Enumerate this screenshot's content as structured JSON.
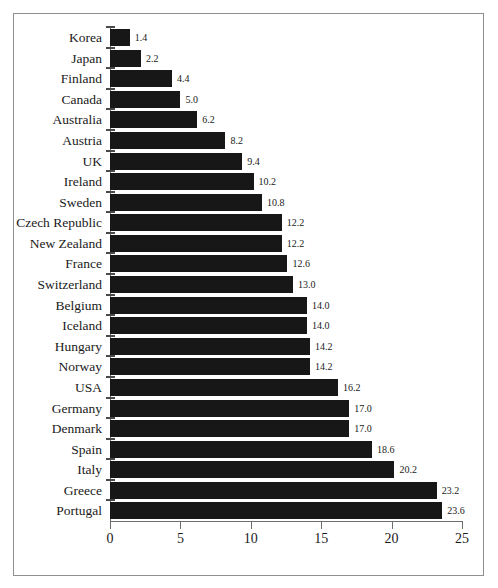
{
  "chart_data": {
    "type": "bar",
    "orientation": "horizontal",
    "title": "",
    "subtitle": "",
    "xlabel": "",
    "ylabel": "",
    "xlim": [
      0,
      25
    ],
    "xticks": [
      0,
      5,
      10,
      15,
      20,
      25
    ],
    "xtick_labels": [
      "0",
      "5",
      "10",
      "15",
      "20",
      "25"
    ],
    "grid": false,
    "legend": null,
    "bar_color": "#171717",
    "axis_color": "#6e6e6e",
    "background": "#ffffff",
    "value_label_format": "one-decimal",
    "categories": [
      "Korea",
      "Japan",
      "Finland",
      "Canada",
      "Australia",
      "Austria",
      "UK",
      "Ireland",
      "Sweden",
      "Czech Republic",
      "New Zealand",
      "France",
      "Switzerland",
      "Belgium",
      "Iceland",
      "Hungary",
      "Norway",
      "USA",
      "Germany",
      "Denmark",
      "Spain",
      "Italy",
      "Greece",
      "Portugal"
    ],
    "values": [
      1.4,
      2.2,
      4.4,
      5.0,
      6.2,
      8.2,
      9.4,
      10.2,
      10.8,
      12.2,
      12.2,
      12.6,
      13.0,
      14.0,
      14.0,
      14.2,
      14.2,
      16.2,
      17.0,
      17.0,
      18.6,
      20.2,
      23.2,
      23.6
    ],
    "value_labels": [
      "1.4",
      "2.2",
      "4.4",
      "5.0",
      "6.2",
      "8.2",
      "9.4",
      "10.2",
      "10.8",
      "12.2",
      "12.2",
      "12.6",
      "13.0",
      "14.0",
      "14.0",
      "14.2",
      "14.2",
      "16.2",
      "17.0",
      "17.0",
      "18.6",
      "20.2",
      "23.2",
      "23.6"
    ]
  }
}
